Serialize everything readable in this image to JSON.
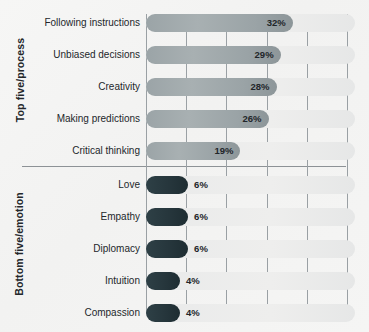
{
  "chart_data": {
    "type": "bar",
    "orientation": "horizontal",
    "title": "",
    "subtitle": "",
    "xlabel": "",
    "ylabel": "",
    "xlim": [
      0,
      50
    ],
    "grid": true,
    "gridlines_at": [
      0,
      10,
      20,
      30,
      40,
      50
    ],
    "legend": "none",
    "value_suffix": "%",
    "groups": [
      {
        "name": "Top five/process",
        "label": "Top five/process",
        "style": "top-style",
        "categories": [
          "Following instructions",
          "Unbiased decisions",
          "Creativity",
          "Making predictions",
          "Critical thinking"
        ],
        "values": [
          32,
          29,
          28,
          26,
          19
        ],
        "value_labels": [
          "32%",
          "29%",
          "28%",
          "26%",
          "19%"
        ]
      },
      {
        "name": "Bottom five/emotion",
        "label": "Bottom five/emotion",
        "style": "bottom-style",
        "categories": [
          "Love",
          "Empathy",
          "Diplomacy",
          "Intuition",
          "Compassion"
        ],
        "values": [
          6,
          6,
          6,
          4,
          4
        ],
        "value_labels": [
          "6%",
          "6%",
          "6%",
          "4%",
          "4%"
        ]
      }
    ],
    "categories": [
      "Following instructions",
      "Unbiased decisions",
      "Creativity",
      "Making predictions",
      "Critical thinking",
      "Love",
      "Empathy",
      "Diplomacy",
      "Intuition",
      "Compassion"
    ],
    "values": [
      32,
      29,
      28,
      26,
      19,
      6,
      6,
      6,
      4,
      4
    ]
  },
  "rows": [
    {
      "label": "Following instructions",
      "value_label": "32%",
      "value": 32,
      "style": "top-style"
    },
    {
      "label": "Unbiased decisions",
      "value_label": "29%",
      "value": 29,
      "style": "top-style"
    },
    {
      "label": "Creativity",
      "value_label": "28%",
      "value": 28,
      "style": "top-style"
    },
    {
      "label": "Making predictions",
      "value_label": "26%",
      "value": 26,
      "style": "top-style"
    },
    {
      "label": "Critical thinking",
      "value_label": "19%",
      "value": 19,
      "style": "top-style"
    },
    {
      "label": "Love",
      "value_label": "6%",
      "value": 6,
      "style": "bottom-style"
    },
    {
      "label": "Empathy",
      "value_label": "6%",
      "value": 6,
      "style": "bottom-style"
    },
    {
      "label": "Diplomacy",
      "value_label": "6%",
      "value": 6,
      "style": "bottom-style"
    },
    {
      "label": "Intuition",
      "value_label": "4%",
      "value": 4,
      "style": "bottom-style"
    },
    {
      "label": "Compassion",
      "value_label": "4%",
      "value": 4,
      "style": "bottom-style"
    }
  ],
  "colors": {
    "background": "#f4f4f3",
    "track": "#eaebeb",
    "bar_top": "#a0a9ac",
    "bar_bottom": "#243338",
    "gridline": "#9aa0a4",
    "separator": "#8d9296",
    "text": "#23272b"
  }
}
